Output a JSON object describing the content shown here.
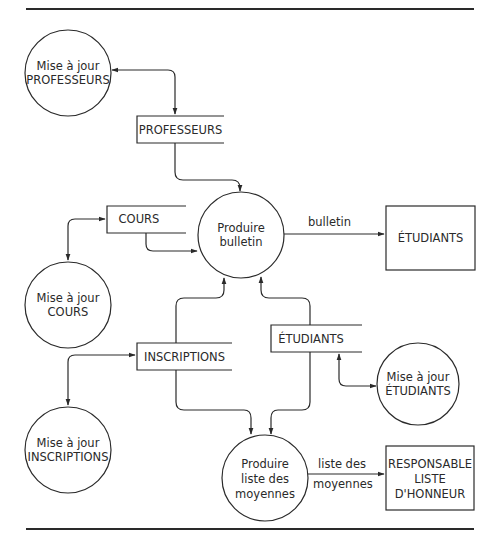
{
  "diagram": {
    "type": "data-flow-diagram",
    "processes": [
      {
        "id": "p_maj_prof",
        "line1": "Mise à jour",
        "line2": "PROFESSEURS"
      },
      {
        "id": "p_bulletin",
        "line1": "Produire",
        "line2": "bulletin"
      },
      {
        "id": "p_maj_cours",
        "line1": "Mise à jour",
        "line2": "COURS"
      },
      {
        "id": "p_maj_etud",
        "line1": "Mise à jour",
        "line2": "ÉTUDIANTS"
      },
      {
        "id": "p_maj_insc",
        "line1": "Mise à jour",
        "line2": "INSCRIPTIONS"
      },
      {
        "id": "p_liste",
        "line1": "Produire",
        "line2": "liste des",
        "line3": "moyennes"
      }
    ],
    "data_stores": [
      {
        "id": "ds_prof",
        "label": "PROFESSEURS"
      },
      {
        "id": "ds_cours",
        "label": "COURS"
      },
      {
        "id": "ds_insc",
        "label": "INSCRIPTIONS"
      },
      {
        "id": "ds_etud",
        "label": "ÉTUDIANTS"
      }
    ],
    "external_entities": [
      {
        "id": "ee_etud",
        "label": "ÉTUDIANTS"
      },
      {
        "id": "ee_resp",
        "line1": "RESPONSABLE",
        "line2": "LISTE",
        "line3": "D'HONNEUR"
      }
    ],
    "flows": [
      {
        "from": "p_maj_prof",
        "to": "ds_prof",
        "bidirectional": true,
        "label": ""
      },
      {
        "from": "ds_prof",
        "to": "p_bulletin",
        "label": ""
      },
      {
        "from": "p_maj_cours",
        "to": "ds_cours",
        "bidirectional": true,
        "label": ""
      },
      {
        "from": "ds_cours",
        "to": "p_bulletin",
        "label": ""
      },
      {
        "from": "p_bulletin",
        "to": "ee_etud",
        "label": "bulletin"
      },
      {
        "from": "ds_insc",
        "to": "p_bulletin",
        "label": ""
      },
      {
        "from": "ds_etud",
        "to": "p_bulletin",
        "label": ""
      },
      {
        "from": "p_maj_insc",
        "to": "ds_insc",
        "bidirectional": true,
        "label": ""
      },
      {
        "from": "p_maj_etud",
        "to": "ds_etud",
        "bidirectional": true,
        "label": ""
      },
      {
        "from": "ds_insc",
        "to": "p_liste",
        "label": ""
      },
      {
        "from": "ds_etud",
        "to": "p_liste",
        "label": ""
      },
      {
        "from": "p_liste",
        "to": "ee_resp",
        "label_line1": "liste des",
        "label_line2": "moyennes"
      }
    ]
  }
}
